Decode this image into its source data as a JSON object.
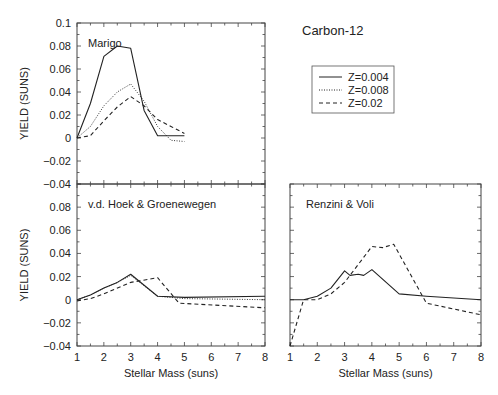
{
  "figure": {
    "title": "Carbon-12",
    "legend": [
      {
        "label": "Z=0.004",
        "style": "solid"
      },
      {
        "label": "Z=0.008",
        "style": "dotted"
      },
      {
        "label": "Z=0.02",
        "style": "dashed"
      }
    ]
  },
  "chart_data": [
    {
      "type": "line",
      "panel": "top-left",
      "title": "Marigo",
      "xlabel": "",
      "ylabel": "YIELD (SUNS)",
      "xlim": [
        1,
        8
      ],
      "ylim": [
        -0.04,
        0.1
      ],
      "yticks": [
        "0.1",
        "0.08",
        "0.06",
        "0.04",
        "0.02",
        "0",
        "-0.02",
        "-0.04"
      ],
      "xticks": [],
      "series": [
        {
          "name": "Z=0.004",
          "style": "solid",
          "x": [
            1,
            1.5,
            2,
            2.5,
            3,
            3.5,
            4,
            4.5,
            5
          ],
          "y": [
            0,
            0.03,
            0.071,
            0.08,
            0.078,
            0.024,
            0.002,
            0.002,
            0.002
          ]
        },
        {
          "name": "Z=0.008",
          "style": "dotted",
          "x": [
            1,
            1.5,
            2,
            2.5,
            3,
            3.5,
            4,
            4.5,
            5
          ],
          "y": [
            0,
            0.01,
            0.028,
            0.04,
            0.047,
            0.032,
            0.01,
            -0.002,
            -0.003
          ]
        },
        {
          "name": "Z=0.02",
          "style": "dashed",
          "x": [
            1,
            1.5,
            2,
            2.5,
            3,
            3.5,
            4,
            4.5,
            5
          ],
          "y": [
            0,
            0.002,
            0.015,
            0.027,
            0.036,
            0.028,
            0.016,
            0.01,
            0.004
          ]
        }
      ]
    },
    {
      "type": "line",
      "panel": "bottom-left",
      "title": "v.d. Hoek & Groenewegen",
      "xlabel": "Stellar Mass (suns)",
      "ylabel": "YIELD (SUNS)",
      "xlim": [
        1,
        8
      ],
      "ylim": [
        -0.04,
        0.1
      ],
      "yticks": [
        "0.08",
        "0.06",
        "0.04",
        "0.02",
        "0",
        "-0.02",
        "-0.04"
      ],
      "xticks": [
        "1",
        "2",
        "3",
        "4",
        "5",
        "6",
        "7",
        "8"
      ],
      "series": [
        {
          "name": "Z=0.004",
          "style": "solid",
          "x": [
            1,
            1.5,
            2,
            2.5,
            3,
            4,
            5,
            8
          ],
          "y": [
            0,
            0.004,
            0.01,
            0.015,
            0.022,
            0.003,
            0.002,
            0.003
          ]
        },
        {
          "name": "Z=0.008",
          "style": "dotted",
          "x": [
            1,
            1.5,
            2,
            2.5,
            3,
            4,
            5,
            8
          ],
          "y": [
            0,
            0.004,
            0.01,
            0.015,
            0.021,
            0.003,
            0.001,
            0.0
          ]
        },
        {
          "name": "Z=0.02",
          "style": "dashed",
          "x": [
            1,
            1.5,
            2,
            3,
            4,
            4.8,
            8
          ],
          "y": [
            -0.001,
            0.001,
            0.005,
            0.015,
            0.019,
            -0.003,
            -0.007
          ]
        }
      ]
    },
    {
      "type": "line",
      "panel": "bottom-right",
      "title": "Renzini & Voli",
      "xlabel": "Stellar Mass (suns)",
      "ylabel": "",
      "xlim": [
        1,
        8
      ],
      "ylim": [
        -0.04,
        0.1
      ],
      "yticks": [],
      "xticks": [
        "1",
        "2",
        "3",
        "4",
        "5",
        "6",
        "7",
        "8"
      ],
      "series": [
        {
          "name": "Z=0.004",
          "style": "solid",
          "x": [
            1,
            1.5,
            2,
            2.5,
            3,
            3.2,
            3.5,
            3.7,
            4,
            5,
            6,
            8
          ],
          "y": [
            0,
            0.0,
            0.003,
            0.01,
            0.025,
            0.021,
            0.022,
            0.021,
            0.026,
            0.005,
            0.003,
            0.0
          ]
        },
        {
          "name": "Z=0.02",
          "style": "dashed",
          "x": [
            1,
            1.5,
            2,
            2.5,
            3,
            4,
            4.4,
            4.8,
            6,
            8
          ],
          "y": [
            -0.04,
            0.0,
            0.0,
            0.005,
            0.015,
            0.046,
            0.045,
            0.048,
            -0.003,
            -0.013
          ]
        }
      ]
    }
  ]
}
